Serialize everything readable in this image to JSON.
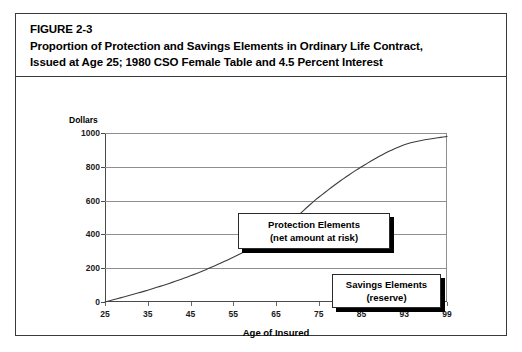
{
  "figure": {
    "number": "FIGURE 2-3",
    "title_line_1": "Proportion of Protection and Savings Elements in Ordinary Life Contract,",
    "title_line_2": "Issued at Age 25; 1980 CSO Female Table and 4.5 Percent Interest"
  },
  "callouts": {
    "protection": {
      "line_1": "Protection Elements",
      "line_2": "(net amount at risk)"
    },
    "savings": {
      "line_1": "Savings Elements",
      "line_2": "(reserve)"
    }
  },
  "chart_data": {
    "type": "line",
    "title": "Proportion of Protection and Savings Elements in Ordinary Life Contract, Issued at Age 25; 1980 CSO Female Table and 4.5 Percent Interest",
    "xlabel": "Age of Insured",
    "ylabel": "Dollars",
    "x_tick_labels": [
      "25",
      "35",
      "45",
      "55",
      "65",
      "75",
      "85",
      "93",
      "99"
    ],
    "y_tick_labels": [
      "0",
      "200",
      "400",
      "600",
      "800",
      "1000"
    ],
    "y_ticks": [
      0,
      200,
      400,
      600,
      800,
      1000
    ],
    "ylim": [
      0,
      1000
    ],
    "grid": true,
    "legend": "none",
    "series": [
      {
        "name": "Reserve (savings element)",
        "x": [
          "25",
          "35",
          "45",
          "55",
          "65",
          "75",
          "85",
          "93",
          "99"
        ],
        "values": [
          0,
          70,
          155,
          265,
          400,
          620,
          800,
          930,
          980
        ]
      }
    ],
    "annotations": [
      "Protection Elements (net amount at risk)",
      "Savings Elements (reserve)"
    ]
  }
}
